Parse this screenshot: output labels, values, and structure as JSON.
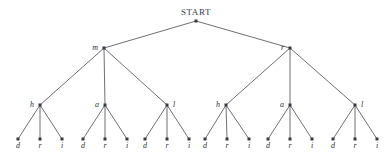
{
  "diagram": {
    "title": "START",
    "kind": "tree",
    "root": {
      "id": "root",
      "label": "START",
      "label_style": "upright",
      "label_position": "above",
      "x": 196,
      "y": 21
    },
    "levels": [
      {
        "name": "level-1-root",
        "y": 21,
        "nodes": [
          {
            "id": "root",
            "label": "START",
            "x": 196,
            "label_position": "above"
          }
        ]
      },
      {
        "name": "level-2-first-letter",
        "y": 48,
        "nodes": [
          {
            "id": "n-m",
            "label": "m",
            "x": 104,
            "label_position": "left",
            "parent": "root"
          },
          {
            "id": "n-r",
            "label": "r",
            "x": 290,
            "label_position": "left",
            "parent": "root"
          }
        ]
      },
      {
        "name": "level-3-second-letter",
        "y": 105,
        "nodes": [
          {
            "id": "n-m-h",
            "label": "h",
            "x": 40,
            "label_position": "left",
            "parent": "n-m"
          },
          {
            "id": "n-m-a",
            "label": "a",
            "x": 105,
            "label_position": "left",
            "parent": "n-m"
          },
          {
            "id": "n-m-l",
            "label": "l",
            "x": 167,
            "label_position": "right",
            "parent": "n-m"
          },
          {
            "id": "n-r-h",
            "label": "h",
            "x": 226,
            "label_position": "left",
            "parent": "n-r"
          },
          {
            "id": "n-r-a",
            "label": "a",
            "x": 290,
            "label_position": "left",
            "parent": "n-r"
          },
          {
            "id": "n-r-l",
            "label": "l",
            "x": 355,
            "label_position": "right",
            "parent": "n-r"
          }
        ]
      },
      {
        "name": "level-4-third-letter-leaves",
        "y": 139,
        "nodes": [
          {
            "id": "l-mh-d",
            "label": "d",
            "x": 18,
            "label_position": "below",
            "parent": "n-m-h"
          },
          {
            "id": "l-mh-r",
            "label": "r",
            "x": 40,
            "label_position": "below",
            "parent": "n-m-h"
          },
          {
            "id": "l-mh-i",
            "label": "i",
            "x": 62,
            "label_position": "below",
            "parent": "n-m-h"
          },
          {
            "id": "l-ma-d",
            "label": "d",
            "x": 83,
            "label_position": "below",
            "parent": "n-m-a"
          },
          {
            "id": "l-ma-r",
            "label": "r",
            "x": 105,
            "label_position": "below",
            "parent": "n-m-a"
          },
          {
            "id": "l-ma-i",
            "label": "i",
            "x": 127,
            "label_position": "below",
            "parent": "n-m-a"
          },
          {
            "id": "l-ml-d",
            "label": "d",
            "x": 145,
            "label_position": "below",
            "parent": "n-m-l"
          },
          {
            "id": "l-ml-r",
            "label": "r",
            "x": 167,
            "label_position": "below",
            "parent": "n-m-l"
          },
          {
            "id": "l-ml-i",
            "label": "i",
            "x": 189,
            "label_position": "below",
            "parent": "n-m-l"
          },
          {
            "id": "l-rh-d",
            "label": "d",
            "x": 205,
            "label_position": "below",
            "parent": "n-r-h"
          },
          {
            "id": "l-rh-r",
            "label": "r",
            "x": 227,
            "label_position": "below",
            "parent": "n-r-h"
          },
          {
            "id": "l-rh-i",
            "label": "i",
            "x": 249,
            "label_position": "below",
            "parent": "n-r-h"
          },
          {
            "id": "l-ra-d",
            "label": "d",
            "x": 268,
            "label_position": "below",
            "parent": "n-r-a"
          },
          {
            "id": "l-ra-r",
            "label": "r",
            "x": 290,
            "label_position": "below",
            "parent": "n-r-a"
          },
          {
            "id": "l-ra-i",
            "label": "i",
            "x": 312,
            "label_position": "below",
            "parent": "n-r-a"
          },
          {
            "id": "l-rl-d",
            "label": "d",
            "x": 333,
            "label_position": "below",
            "parent": "n-r-l"
          },
          {
            "id": "l-rl-r",
            "label": "r",
            "x": 355,
            "label_position": "below",
            "parent": "n-r-l"
          },
          {
            "id": "l-rl-i",
            "label": "i",
            "x": 377,
            "label_position": "below",
            "parent": "n-r-l"
          }
        ]
      }
    ],
    "edges": [
      {
        "from": "root",
        "to": "n-m"
      },
      {
        "from": "root",
        "to": "n-r"
      },
      {
        "from": "n-m",
        "to": "n-m-h"
      },
      {
        "from": "n-m",
        "to": "n-m-a"
      },
      {
        "from": "n-m",
        "to": "n-m-l"
      },
      {
        "from": "n-r",
        "to": "n-r-h"
      },
      {
        "from": "n-r",
        "to": "n-r-a"
      },
      {
        "from": "n-r",
        "to": "n-r-l"
      },
      {
        "from": "n-m-h",
        "to": "l-mh-d"
      },
      {
        "from": "n-m-h",
        "to": "l-mh-r"
      },
      {
        "from": "n-m-h",
        "to": "l-mh-i"
      },
      {
        "from": "n-m-a",
        "to": "l-ma-d"
      },
      {
        "from": "n-m-a",
        "to": "l-ma-r"
      },
      {
        "from": "n-m-a",
        "to": "l-ma-i"
      },
      {
        "from": "n-m-l",
        "to": "l-ml-d"
      },
      {
        "from": "n-m-l",
        "to": "l-ml-r"
      },
      {
        "from": "n-m-l",
        "to": "l-ml-i"
      },
      {
        "from": "n-r-h",
        "to": "l-rh-d"
      },
      {
        "from": "n-r-h",
        "to": "l-rh-r"
      },
      {
        "from": "n-r-h",
        "to": "l-rh-i"
      },
      {
        "from": "n-r-a",
        "to": "l-ra-d"
      },
      {
        "from": "n-r-a",
        "to": "l-ra-r"
      },
      {
        "from": "n-r-a",
        "to": "l-ra-i"
      },
      {
        "from": "n-r-l",
        "to": "l-rl-d"
      },
      {
        "from": "n-r-l",
        "to": "l-rl-r"
      },
      {
        "from": "n-r-l",
        "to": "l-rl-i"
      }
    ],
    "colors": {
      "background": "#ffffff",
      "edge": "#4a4a52",
      "node": "#3a3a42",
      "label": "#2e2e36",
      "root_label": "#3b3b43"
    },
    "geometry": {
      "width": 392,
      "height": 157,
      "node_radius": 1.5,
      "label_offset_x": 6,
      "label_offset_y_below": 9,
      "label_offset_y_above": 6
    }
  }
}
